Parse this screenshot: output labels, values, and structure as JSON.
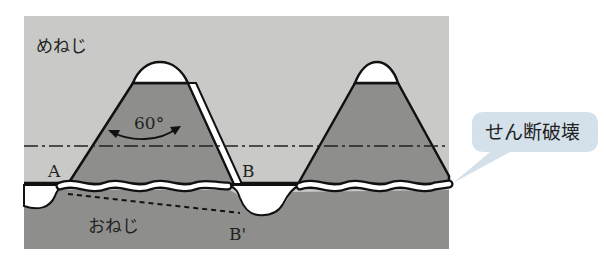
{
  "diagram": {
    "labels": {
      "female_thread": "めねじ",
      "male_thread": "おねじ",
      "angle": "60°",
      "point_a": "A",
      "point_b": "B",
      "point_b_prime": "B'"
    },
    "callout": {
      "text": "せん断破壊"
    },
    "colors": {
      "background": "#ffffff",
      "female_region": "#c9c9c7",
      "thread_body": "#8e8e8c",
      "gap": "#ffffff",
      "outline": "#111111",
      "callout_fill": "#d4e0ea"
    }
  }
}
